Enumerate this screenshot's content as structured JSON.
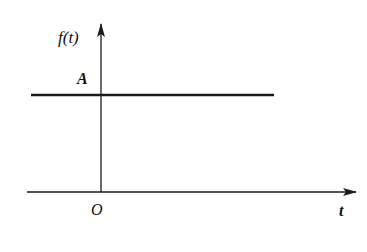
{
  "diagram": {
    "type": "constant-signal-plot",
    "y_axis_label": "f(t)",
    "x_axis_label": "t",
    "origin_label": "O",
    "level_label": "A",
    "signal": {
      "kind": "constant",
      "value_label": "A",
      "extends": "both directions from origin"
    },
    "colors": {
      "line": "#1a1a1a",
      "background": "#ffffff"
    }
  }
}
